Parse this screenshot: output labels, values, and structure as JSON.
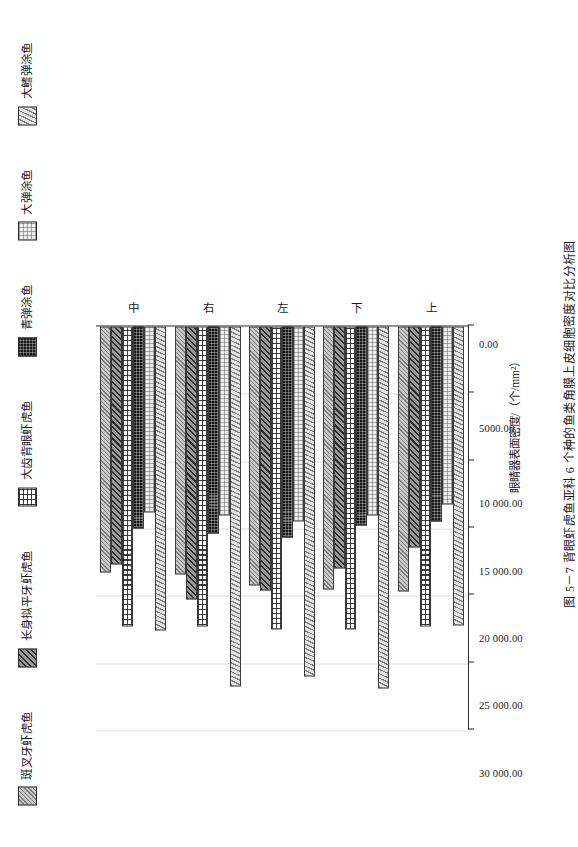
{
  "figure": {
    "caption": "图 5－7  背眼虾虎鱼亚科 6 个种的鱼类角膜上皮细胞密度对比分析图"
  },
  "chart_data": {
    "type": "bar",
    "orientation": "horizontal",
    "title": "图 5－7  背眼虾虎鱼亚科 6 个种的鱼类角膜上皮细胞密度对比分析图",
    "xlabel": "",
    "ylabel": "眼睛器表面密度/（个/mm²）",
    "categories": [
      "上",
      "下",
      "左",
      "右",
      "中"
    ],
    "ylim": [
      0,
      30000
    ],
    "yticks": [
      0,
      5000,
      10000,
      15000,
      20000,
      25000,
      30000
    ],
    "ytick_labels": [
      "0.00",
      "5000.00",
      "10 000.00",
      "15 000.00",
      "20 000.00",
      "25 000.00",
      "30 000.00"
    ],
    "grid": true,
    "legend_position": "top",
    "series": [
      {
        "name": "斑叉牙虾虎鱼",
        "pattern": "diagonal-light",
        "values": [
          19700,
          19500,
          19200,
          18400,
          18300
        ]
      },
      {
        "name": "长身拟平牙虾虎鱼",
        "pattern": "diagonal-dark",
        "values": [
          16400,
          18000,
          19600,
          20300,
          17700
        ]
      },
      {
        "name": "大齿背眼虾虎鱼",
        "pattern": "grid-white",
        "values": [
          22300,
          22500,
          22500,
          22300,
          22300
        ]
      },
      {
        "name": "青弹涂鱼",
        "pattern": "solid-black",
        "values": [
          14500,
          14800,
          15700,
          15400,
          15000
        ]
      },
      {
        "name": "大弹涂鱼",
        "pattern": "dotted-light",
        "values": [
          13200,
          14000,
          14500,
          14000,
          13800
        ]
      },
      {
        "name": "大鳍弹涂鱼",
        "pattern": "diagonal-hatch",
        "values": [
          22200,
          26900,
          26000,
          26700,
          22600
        ]
      }
    ]
  },
  "legend": {
    "items": [
      {
        "label": "斑叉牙虾虎鱼"
      },
      {
        "label": "长身拟平牙虾虎鱼"
      },
      {
        "label": "大齿背眼虾虎鱼"
      },
      {
        "label": "青弹涂鱼"
      },
      {
        "label": "大弹涂鱼"
      },
      {
        "label": "大鳍弹涂鱼"
      }
    ]
  },
  "axes": {
    "value_axis_title": "眼睛器表面密度/（个/mm²）",
    "value_ticks": [
      "30 000.00",
      "25 000.00",
      "20 000.00",
      "15 000.00",
      "10 000.00",
      "5000.00",
      "0.00"
    ],
    "category_ticks": [
      "中",
      "右",
      "左",
      "下",
      "上"
    ]
  },
  "colors": {
    "axis": "#2b2b2b",
    "grid": "#dedede",
    "background": "#ffffff",
    "bar_outline": "#3a3a3a"
  }
}
